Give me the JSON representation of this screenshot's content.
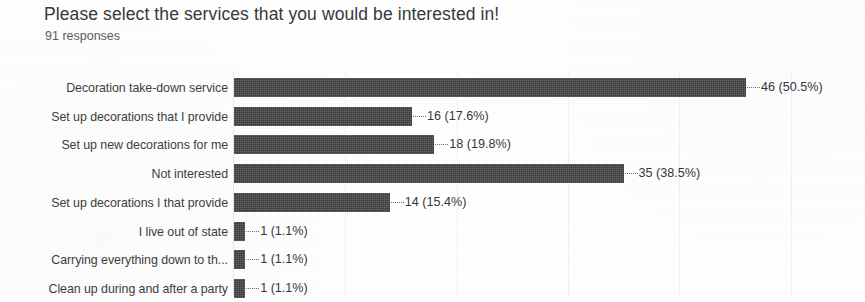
{
  "header": {
    "title": "Please select the services that you would be interested in!",
    "response_count": "91 responses"
  },
  "chart_data": {
    "type": "bar",
    "orientation": "horizontal",
    "title": "Please select the services that you would be interested in!",
    "subtitle": "91 responses",
    "xlabel": "",
    "ylabel": "",
    "xlim": [
      0,
      50
    ],
    "grid": true,
    "gridlines": [
      10,
      20,
      30,
      40,
      50
    ],
    "legend": "none",
    "total_responses": 91,
    "bar_color": "#3b3b3b",
    "categories": [
      "Decoration take-down service",
      "Set up decorations that I provide",
      "Set up new decorations for me",
      "Not interested",
      "Set up decorations I that provide",
      "I live out of state",
      "Carrying everything down to th...",
      "Clean up during and after a party"
    ],
    "values": [
      46,
      16,
      18,
      35,
      14,
      1,
      1,
      1
    ],
    "percents": [
      50.5,
      17.6,
      19.8,
      38.5,
      15.4,
      1.1,
      1.1,
      1.1
    ],
    "data_labels": [
      "46 (50.5%)",
      "16 (17.6%)",
      "18 (19.8%)",
      "35 (38.5%)",
      "14 (15.4%)",
      "1 (1.1%)",
      "1 (1.1%)",
      "1 (1.1%)"
    ]
  }
}
